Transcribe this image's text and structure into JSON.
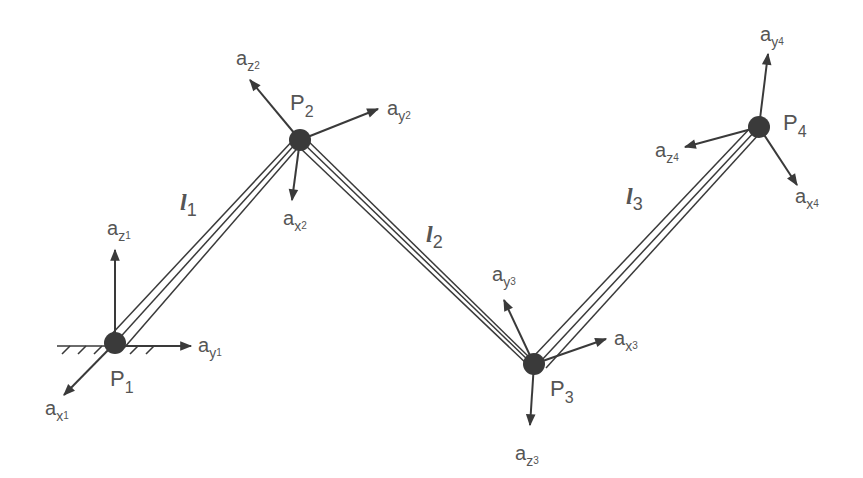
{
  "diagram": {
    "type": "serial-manipulator-frames",
    "colors": {
      "line": "#3a3a3a",
      "joint": "#3a3a3a",
      "text": "#555555",
      "background": "#ffffff"
    },
    "joints": [
      {
        "id": "P1",
        "label": "P",
        "sub": "1",
        "x": 115,
        "y": 343
      },
      {
        "id": "P2",
        "label": "P",
        "sub": "2",
        "x": 300,
        "y": 140
      },
      {
        "id": "P3",
        "label": "P",
        "sub": "3",
        "x": 534,
        "y": 364
      },
      {
        "id": "P4",
        "label": "P",
        "sub": "4",
        "x": 759,
        "y": 127
      }
    ],
    "links": [
      {
        "id": "l1",
        "label": "l",
        "sub": "1",
        "from": "P1",
        "to": "P2"
      },
      {
        "id": "l2",
        "label": "l",
        "sub": "2",
        "from": "P2",
        "to": "P3"
      },
      {
        "id": "l3",
        "label": "l",
        "sub": "3",
        "from": "P3",
        "to": "P4"
      }
    ],
    "axes": [
      {
        "label": "a",
        "axis": "z",
        "index": "1",
        "tip": [
          115,
          248
        ]
      },
      {
        "label": "a",
        "axis": "y",
        "index": "1",
        "tip": [
          193,
          346
        ]
      },
      {
        "label": "a",
        "axis": "x",
        "index": "1",
        "tip": [
          62,
          397
        ]
      },
      {
        "label": "a",
        "axis": "z",
        "index": "2",
        "tip": [
          248,
          78
        ]
      },
      {
        "label": "a",
        "axis": "y",
        "index": "2",
        "tip": [
          380,
          108
        ]
      },
      {
        "label": "a",
        "axis": "x",
        "index": "2",
        "tip": [
          292,
          202
        ]
      },
      {
        "label": "a",
        "axis": "y",
        "index": "3",
        "tip": [
          503,
          298
        ]
      },
      {
        "label": "a",
        "axis": "x",
        "index": "3",
        "tip": [
          608,
          338
        ]
      },
      {
        "label": "a",
        "axis": "z",
        "index": "3",
        "tip": [
          530,
          427
        ]
      },
      {
        "label": "a",
        "axis": "y",
        "index": "4",
        "tip": [
          768,
          52
        ]
      },
      {
        "label": "a",
        "axis": "z",
        "index": "4",
        "tip": [
          683,
          148
        ]
      },
      {
        "label": "a",
        "axis": "x",
        "index": "4",
        "tip": [
          798,
          187
        ]
      }
    ],
    "ground": {
      "label": "fixed base",
      "attached_to": "P1"
    }
  },
  "labels": {
    "p1": {
      "main": "P",
      "sub": "1"
    },
    "p2": {
      "main": "P",
      "sub": "2"
    },
    "p3": {
      "main": "P",
      "sub": "3"
    },
    "p4": {
      "main": "P",
      "sub": "4"
    },
    "l1": {
      "main": "l",
      "sub": "1"
    },
    "l2": {
      "main": "l",
      "sub": "2"
    },
    "l3": {
      "main": "l",
      "sub": "3"
    },
    "az1": {
      "main": "a",
      "sub": "z",
      "sub2": "1"
    },
    "ay1": {
      "main": "a",
      "sub": "y",
      "sub2": "1"
    },
    "ax1": {
      "main": "a",
      "sub": "x",
      "sub2": "1"
    },
    "az2": {
      "main": "a",
      "sub": "z",
      "sub2": "2"
    },
    "ay2": {
      "main": "a",
      "sub": "y",
      "sub2": "2"
    },
    "ax2": {
      "main": "a",
      "sub": "x",
      "sub2": "2"
    },
    "ay3": {
      "main": "a",
      "sub": "y",
      "sub2": "3"
    },
    "ax3": {
      "main": "a",
      "sub": "x",
      "sub2": "3"
    },
    "az3": {
      "main": "a",
      "sub": "z",
      "sub2": "3"
    },
    "ay4": {
      "main": "a",
      "sub": "y",
      "sub2": "4"
    },
    "az4": {
      "main": "a",
      "sub": "z",
      "sub2": "4"
    },
    "ax4": {
      "main": "a",
      "sub": "x",
      "sub2": "4"
    }
  }
}
